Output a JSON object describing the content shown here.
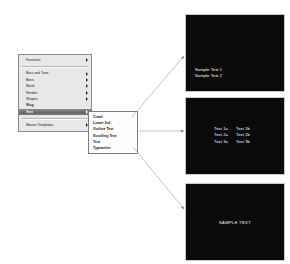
{
  "menu": {
    "name": "generators-menu",
    "groups": [
      {
        "items": [
          {
            "label": "Favorites",
            "has_submenu": true,
            "selected": false,
            "bold": false
          }
        ]
      },
      {
        "items": [
          {
            "label": "Bars and Tone",
            "has_submenu": true,
            "selected": false,
            "bold": false
          },
          {
            "label": "Boris",
            "has_submenu": true,
            "selected": false,
            "bold": false
          },
          {
            "label": "Matte",
            "has_submenu": true,
            "selected": false,
            "bold": false
          },
          {
            "label": "Render",
            "has_submenu": true,
            "selected": false,
            "bold": false
          },
          {
            "label": "Shapes",
            "has_submenu": true,
            "selected": false,
            "bold": false
          },
          {
            "label": "Slug",
            "has_submenu": false,
            "selected": false,
            "bold": true
          },
          {
            "label": "Text",
            "has_submenu": true,
            "selected": true,
            "bold": true
          }
        ]
      },
      {
        "items": [
          {
            "label": "Master Templates",
            "has_submenu": true,
            "selected": false,
            "bold": false
          }
        ]
      }
    ]
  },
  "submenu": {
    "name": "text-submenu",
    "items": [
      {
        "label": "Crawl"
      },
      {
        "label": "Lower 3rd"
      },
      {
        "label": "Outline Text"
      },
      {
        "label": "Scrolling Text"
      },
      {
        "label": "Text"
      },
      {
        "label": "Typewriter"
      }
    ]
  },
  "previews": {
    "lower_third": {
      "name": "preview-lower-third",
      "line1": "Sample Text 1",
      "line2": "Sample Text 2"
    },
    "scrolling": {
      "name": "preview-scrolling-text",
      "rows": [
        {
          "a": "Text 1a",
          "b": "Text 1b"
        },
        {
          "a": "Text 2a",
          "b": "Text 2b"
        },
        {
          "a": "Text 3a",
          "b": "Text 3b"
        }
      ]
    },
    "text": {
      "name": "preview-text",
      "caption": "SAMPLE TEXT"
    }
  },
  "colors": {
    "menu_background": "#e8e8e8",
    "menu_border": "#8a8a8a",
    "selection": "#6f6f6f",
    "submenu_background": "#fdfdfd",
    "preview_background": "#0a0a0a",
    "preview_text": "#ffffff",
    "arrow": "#9a9a9a"
  },
  "arrows": [
    {
      "name": "arrow-to-lower-third",
      "direction": "up-right"
    },
    {
      "name": "arrow-to-scrolling-text",
      "direction": "right"
    },
    {
      "name": "arrow-to-text",
      "direction": "down-right"
    }
  ]
}
